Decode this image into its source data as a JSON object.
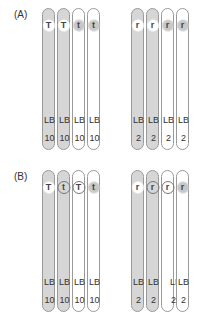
{
  "panels": [
    {
      "label": "(A)",
      "chromosomes": [
        {
          "fill": "gray",
          "allele": "T",
          "allele_style": "glow-white",
          "band": "LB",
          "number": "10"
        },
        {
          "fill": "gray",
          "allele": "T",
          "allele_style": "glow-white",
          "band": "LB",
          "number": "10"
        },
        {
          "fill": "white",
          "allele": "t",
          "allele_style": "glow-gray",
          "band": "LB",
          "number": "10"
        },
        {
          "fill": "white",
          "allele": "t",
          "allele_style": "glow-gray",
          "band": "LB",
          "number": "10"
        },
        {
          "fill": "gray",
          "allele": "r",
          "allele_style": "glow-white",
          "band": "LB",
          "number": "2"
        },
        {
          "fill": "gray",
          "allele": "r",
          "allele_style": "glow-white",
          "band": "LB",
          "number": "2"
        },
        {
          "fill": "white",
          "allele": "r",
          "allele_style": "glow-gray",
          "band": "LB",
          "number": "2"
        },
        {
          "fill": "white",
          "allele": "r",
          "allele_style": "glow-gray",
          "band": "LB",
          "number": "2"
        }
      ]
    },
    {
      "label": "(B)",
      "chromosomes": [
        {
          "fill": "gray",
          "allele": "T",
          "allele_style": "glow-white",
          "band": "LB",
          "number": "10"
        },
        {
          "fill": "gray",
          "allele": "t",
          "allele_style": "ring",
          "band": "LB",
          "number": "10"
        },
        {
          "fill": "white",
          "allele": "T",
          "allele_style": "ring",
          "band": "LB",
          "number": "10"
        },
        {
          "fill": "white",
          "allele": "t",
          "allele_style": "glow-gray",
          "band": "LB",
          "number": "10"
        },
        {
          "fill": "gray",
          "allele": "r",
          "allele_style": "glow-white",
          "band": "LB",
          "number": "2"
        },
        {
          "fill": "gray",
          "allele": "r",
          "allele_style": "ring",
          "band": "LB",
          "number": "2"
        },
        {
          "fill": "white",
          "allele": "r",
          "allele_style": "ring",
          "band": "LB",
          "number": "2"
        },
        {
          "fill": "white",
          "allele": "r",
          "allele_style": "glow-gray",
          "band": "LB",
          "number": "2"
        }
      ]
    }
  ]
}
